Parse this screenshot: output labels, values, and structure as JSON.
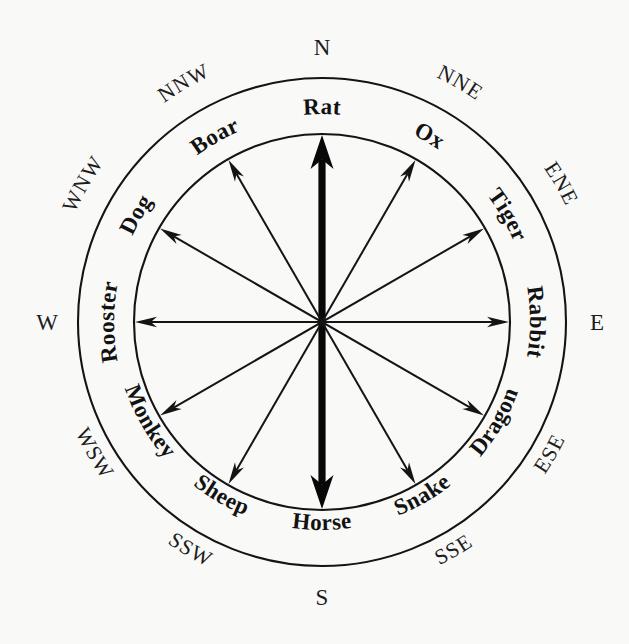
{
  "diagram": {
    "type": "compass-rose",
    "background_color": "#f9f9f8",
    "ink_color": "#141414",
    "geometry": {
      "center_x": 322,
      "center_y": 322,
      "outer_radius": 244,
      "inner_radius": 188,
      "spoke_count": 12,
      "axis_count": 6,
      "degrees_per_sector": 30
    },
    "zodiac_ring": {
      "description": "Twelve Chinese zodiac animals in the annulus between the outer and inner circles, one per 30-degree sector.",
      "items": [
        {
          "label": "Rat",
          "bearing_deg": 0,
          "compass": "N",
          "index": 0
        },
        {
          "label": "Ox",
          "bearing_deg": 30,
          "compass": "NNE",
          "index": 1
        },
        {
          "label": "Tiger",
          "bearing_deg": 60,
          "compass": "ENE",
          "index": 2
        },
        {
          "label": "Rabbit",
          "bearing_deg": 90,
          "compass": "E",
          "index": 3
        },
        {
          "label": "Dragon",
          "bearing_deg": 120,
          "compass": "ESE",
          "index": 4
        },
        {
          "label": "Snake",
          "bearing_deg": 150,
          "compass": "SSE",
          "index": 5
        },
        {
          "label": "Horse",
          "bearing_deg": 180,
          "compass": "S",
          "index": 6
        },
        {
          "label": "Sheep",
          "bearing_deg": 210,
          "compass": "SSW",
          "index": 7
        },
        {
          "label": "Monkey",
          "bearing_deg": 240,
          "compass": "WSW",
          "index": 8
        },
        {
          "label": "Rooster",
          "bearing_deg": 270,
          "compass": "W",
          "index": 9
        },
        {
          "label": "Dog",
          "bearing_deg": 300,
          "compass": "WNW",
          "index": 10
        },
        {
          "label": "Boar",
          "bearing_deg": 330,
          "compass": "NNW",
          "index": 11
        }
      ]
    },
    "compass_ring": {
      "description": "Twelve compass bearings printed outside the outer circle.",
      "items": [
        {
          "label": "N",
          "bearing_deg": 0,
          "index": 0
        },
        {
          "label": "NNE",
          "bearing_deg": 30,
          "index": 1
        },
        {
          "label": "ENE",
          "bearing_deg": 60,
          "index": 2
        },
        {
          "label": "E",
          "bearing_deg": 90,
          "index": 3
        },
        {
          "label": "ESE",
          "bearing_deg": 120,
          "index": 4
        },
        {
          "label": "SSE",
          "bearing_deg": 150,
          "index": 5
        },
        {
          "label": "S",
          "bearing_deg": 180,
          "index": 6
        },
        {
          "label": "SSW",
          "bearing_deg": 210,
          "index": 7
        },
        {
          "label": "WSW",
          "bearing_deg": 240,
          "index": 8
        },
        {
          "label": "W",
          "bearing_deg": 270,
          "index": 9
        },
        {
          "label": "WNW",
          "bearing_deg": 300,
          "index": 10
        },
        {
          "label": "NNW",
          "bearing_deg": 330,
          "index": 11
        }
      ]
    },
    "axes": {
      "description": "Six double-headed arrows through the centre; the North-South axis is drawn bold/heavy, the other five are thin.",
      "items": [
        {
          "name": "N-S",
          "bearing_deg": 0,
          "weight": "bold",
          "from": "Horse",
          "to": "Rat"
        },
        {
          "name": "NNE-SSW",
          "bearing_deg": 30,
          "weight": "thin",
          "from": "Sheep",
          "to": "Ox"
        },
        {
          "name": "ENE-WSW",
          "bearing_deg": 60,
          "weight": "thin",
          "from": "Monkey",
          "to": "Tiger"
        },
        {
          "name": "E-W",
          "bearing_deg": 90,
          "weight": "thin",
          "from": "Rooster",
          "to": "Rabbit"
        },
        {
          "name": "ESE-WNW",
          "bearing_deg": 120,
          "weight": "thin",
          "from": "Dog",
          "to": "Dragon"
        },
        {
          "name": "SSE-NNW",
          "bearing_deg": 150,
          "weight": "thin",
          "from": "Boar",
          "to": "Snake"
        }
      ]
    }
  }
}
